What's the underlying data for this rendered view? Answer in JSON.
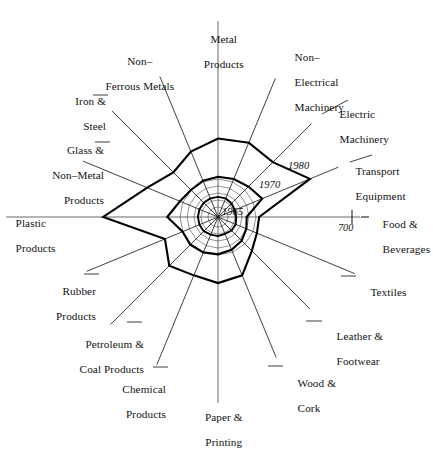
{
  "chart_data": {
    "type": "radar",
    "title": "",
    "subtitle": "",
    "xlabel": "",
    "ylabel": "",
    "grid": true,
    "legend_position": "inline-annotations",
    "center": {
      "x": 218,
      "y": 217
    },
    "radial_axis": {
      "tick_labels": [
        "700"
      ],
      "tick_radius_px": [
        134
      ],
      "tick_axis": "Food & Beverages",
      "max_value": 700
    },
    "categories": [
      "Metal Products",
      "Non–Electrical Machinery",
      "Electric Machinery",
      "Transport Equipment",
      "Food & Beverages",
      "Textiles",
      "Leather & Footwear",
      "Wood & Cork",
      "Paper & Printing",
      "Chemical Products",
      "Petroleum & Coal Products",
      "Rubber Products",
      "Plastic Products",
      "Glass & Non–Metal Products",
      "Iron & Steel",
      "Non–Ferrous Metals"
    ],
    "category_label_lines": [
      [
        "Metal",
        "Products"
      ],
      [
        "Non–",
        "Electrical",
        "Machinery"
      ],
      [
        "Electric",
        "Machinery"
      ],
      [
        "Transport",
        "Equipment"
      ],
      [
        "Food &",
        "Beverages"
      ],
      [
        "Textiles"
      ],
      [
        "Leather &",
        "Footwear"
      ],
      [
        "Wood &",
        "Cork"
      ],
      [
        "Paper &",
        "Printing"
      ],
      [
        "Chemical",
        "Products"
      ],
      [
        "Petroleum &",
        "Coal Products"
      ],
      [
        "Rubber",
        "Products"
      ],
      [
        "Plastic",
        "Products"
      ],
      [
        "Glass &",
        "Non–Metal",
        "Products"
      ],
      [
        "Iron &",
        "Steel"
      ],
      [
        "Non–",
        "Ferrous Metals"
      ]
    ],
    "series": [
      {
        "name": "1965",
        "label": "1965",
        "values": [
          105,
          105,
          100,
          95,
          95,
          100,
          100,
          95,
          100,
          100,
          105,
          105,
          105,
          105,
          105,
          105
        ]
      },
      {
        "name": "1970",
        "label": "1970",
        "values": [
          210,
          215,
          225,
          250,
          150,
          160,
          175,
          185,
          195,
          200,
          205,
          200,
          265,
          215,
          200,
          205
        ]
      },
      {
        "name": "1980",
        "label": "1980",
        "values": [
          410,
          420,
          405,
          520,
          215,
          220,
          250,
          330,
          345,
          330,
          360,
          300,
          600,
          400,
          330,
          370
        ]
      }
    ]
  },
  "annotations": {
    "year_1980": "1980",
    "year_1970": "1970",
    "year_1965": "1965",
    "tick_700": "700"
  }
}
